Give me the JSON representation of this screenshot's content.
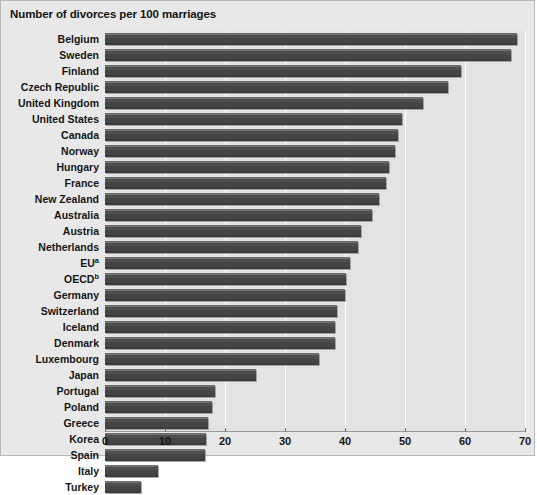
{
  "chart_data": {
    "type": "bar",
    "orientation": "horizontal",
    "title": "Number of divorces per 100 marriages",
    "xlabel": "",
    "ylabel": "",
    "xlim": [
      0,
      70
    ],
    "xticks": [
      0,
      10,
      20,
      30,
      40,
      50,
      60,
      70
    ],
    "grid": true,
    "legend": null,
    "categories": [
      "Belgium",
      "Sweden",
      "Finland",
      "Czech Republic",
      "United Kingdom",
      "United States",
      "Canada",
      "Norway",
      "Hungary",
      "France",
      "New Zealand",
      "Australia",
      "Austria",
      "Netherlands",
      "EU",
      "OECD",
      "Germany",
      "Switzerland",
      "Iceland",
      "Denmark",
      "Luxembourg",
      "Japan",
      "Portugal",
      "Poland",
      "Greece",
      "Korea",
      "Spain",
      "Italy",
      "Turkey"
    ],
    "category_footnotes": {
      "EU": "a",
      "OECD": "b"
    },
    "values": [
      68.7,
      67.7,
      59.3,
      57.2,
      53.0,
      49.5,
      48.8,
      48.4,
      47.3,
      46.8,
      45.7,
      44.5,
      42.7,
      42.2,
      40.8,
      40.2,
      40.0,
      38.6,
      38.4,
      38.3,
      35.7,
      25.2,
      18.3,
      17.9,
      17.1,
      16.9,
      16.7,
      8.9,
      6.0
    ],
    "bar_color": "#474747",
    "plot_background": "#e3e3e3",
    "gridline_color": "#ffffff"
  }
}
